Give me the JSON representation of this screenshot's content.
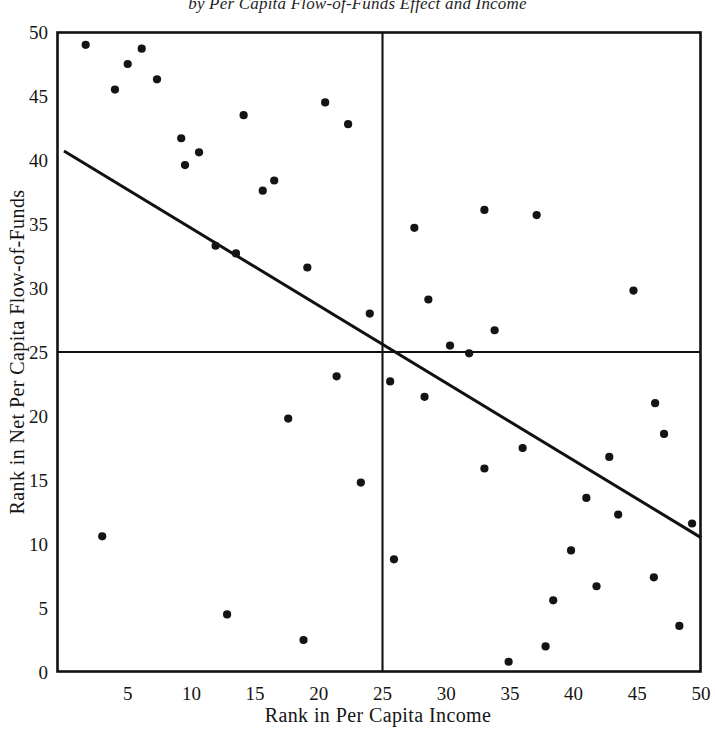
{
  "chart_data": {
    "type": "scatter",
    "title": "by Per Capita Flow-of-Funds Effect and Income",
    "xlabel": "Rank in Per Capita Income",
    "ylabel": "Rank in Net Per Capita Flow-of-Funds",
    "xlim": [
      0,
      50
    ],
    "ylim": [
      0,
      50
    ],
    "xticks": [
      5,
      10,
      15,
      20,
      25,
      30,
      35,
      40,
      45,
      50
    ],
    "yticks": [
      0,
      5,
      10,
      15,
      20,
      25,
      30,
      35,
      40,
      45,
      50
    ],
    "xtick_labels": [
      "5",
      "10",
      "15",
      "20",
      "25",
      "30",
      "35",
      "40",
      "45",
      "50"
    ],
    "ytick_labels": [
      "0",
      "5",
      "10",
      "15",
      "20",
      "25",
      "30",
      "35",
      "40",
      "45",
      "50"
    ],
    "grid": false,
    "legend": null,
    "marker": "filled-circle",
    "marker_color": "#141414",
    "reference_lines": [
      {
        "name": "vertical-median-line",
        "orientation": "vertical",
        "value": 25
      },
      {
        "name": "horizontal-median-line",
        "orientation": "horizontal",
        "value": 25
      }
    ],
    "fit_line": {
      "name": "regression-line",
      "x": [
        0,
        50
      ],
      "y": [
        40.7,
        10.5
      ]
    },
    "points": [
      {
        "x": 1.7,
        "y": 49.0
      },
      {
        "x": 4.0,
        "y": 45.5
      },
      {
        "x": 5.0,
        "y": 47.5
      },
      {
        "x": 6.1,
        "y": 48.7
      },
      {
        "x": 7.3,
        "y": 46.3
      },
      {
        "x": 9.2,
        "y": 41.7
      },
      {
        "x": 9.5,
        "y": 39.6
      },
      {
        "x": 10.6,
        "y": 40.6
      },
      {
        "x": 11.9,
        "y": 33.3
      },
      {
        "x": 13.5,
        "y": 32.7
      },
      {
        "x": 14.1,
        "y": 43.5
      },
      {
        "x": 15.6,
        "y": 37.6
      },
      {
        "x": 16.5,
        "y": 38.4
      },
      {
        "x": 19.1,
        "y": 31.6
      },
      {
        "x": 20.5,
        "y": 44.5
      },
      {
        "x": 22.3,
        "y": 42.8
      },
      {
        "x": 24.0,
        "y": 28.0
      },
      {
        "x": 21.4,
        "y": 23.1
      },
      {
        "x": 25.6,
        "y": 22.7
      },
      {
        "x": 28.3,
        "y": 21.5
      },
      {
        "x": 28.6,
        "y": 29.1
      },
      {
        "x": 27.5,
        "y": 34.7
      },
      {
        "x": 30.3,
        "y": 25.5
      },
      {
        "x": 31.8,
        "y": 24.9
      },
      {
        "x": 33.8,
        "y": 26.7
      },
      {
        "x": 33.0,
        "y": 36.1
      },
      {
        "x": 37.1,
        "y": 35.7
      },
      {
        "x": 44.7,
        "y": 29.8
      },
      {
        "x": 3.0,
        "y": 10.6
      },
      {
        "x": 17.6,
        "y": 19.8
      },
      {
        "x": 23.3,
        "y": 14.8
      },
      {
        "x": 12.8,
        "y": 4.5
      },
      {
        "x": 18.8,
        "y": 2.5
      },
      {
        "x": 25.9,
        "y": 8.8
      },
      {
        "x": 33.0,
        "y": 15.9
      },
      {
        "x": 34.9,
        "y": 0.8
      },
      {
        "x": 36.0,
        "y": 17.5
      },
      {
        "x": 37.8,
        "y": 2.0
      },
      {
        "x": 38.4,
        "y": 5.6
      },
      {
        "x": 39.8,
        "y": 9.5
      },
      {
        "x": 41.0,
        "y": 13.6
      },
      {
        "x": 41.8,
        "y": 6.7
      },
      {
        "x": 42.8,
        "y": 16.8
      },
      {
        "x": 43.5,
        "y": 12.3
      },
      {
        "x": 46.3,
        "y": 7.4
      },
      {
        "x": 46.4,
        "y": 21.0
      },
      {
        "x": 47.1,
        "y": 18.6
      },
      {
        "x": 48.3,
        "y": 3.6
      },
      {
        "x": 49.3,
        "y": 11.6
      }
    ]
  }
}
